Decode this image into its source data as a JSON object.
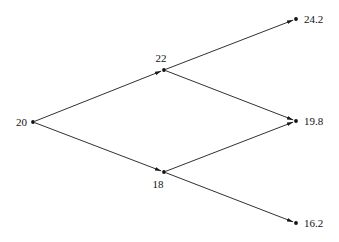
{
  "diagram": {
    "type": "binomial-tree",
    "colors": {
      "line": "#1a1a1a",
      "node": "#111111",
      "text": "#111111"
    },
    "nodes": [
      {
        "id": "n0",
        "label": "20",
        "x": 33,
        "y": 122,
        "label_pos": "left"
      },
      {
        "id": "u",
        "label": "22",
        "x": 164,
        "y": 70,
        "label_pos": "above"
      },
      {
        "id": "d",
        "label": "18",
        "x": 164,
        "y": 172,
        "label_pos": "below"
      },
      {
        "id": "uu",
        "label": "24.2",
        "x": 296,
        "y": 19,
        "label_pos": "right"
      },
      {
        "id": "ud",
        "label": "19.8",
        "x": 296,
        "y": 121,
        "label_pos": "right"
      },
      {
        "id": "dd",
        "label": "16.2",
        "x": 296,
        "y": 223,
        "label_pos": "right"
      }
    ],
    "edges": [
      {
        "from": "n0",
        "to": "u"
      },
      {
        "from": "n0",
        "to": "d"
      },
      {
        "from": "u",
        "to": "uu"
      },
      {
        "from": "u",
        "to": "ud"
      },
      {
        "from": "d",
        "to": "ud"
      },
      {
        "from": "d",
        "to": "dd"
      }
    ]
  }
}
